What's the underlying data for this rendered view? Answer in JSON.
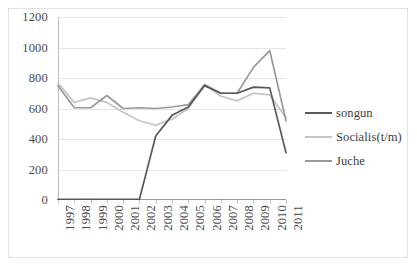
{
  "chart_data": {
    "type": "line",
    "title": "",
    "xlabel": "",
    "ylabel": "",
    "ylim": [
      0,
      1200
    ],
    "ytick_step": 200,
    "yticks": [
      "0",
      "200",
      "400",
      "600",
      "800",
      "1000",
      "1200"
    ],
    "grid": true,
    "legend_position": "right",
    "categories": [
      "1997",
      "1998",
      "1999",
      "2000",
      "2001",
      "2002",
      "2003",
      "2004",
      "2005",
      "2006",
      "2007",
      "2008",
      "2009",
      "2010",
      "2011"
    ],
    "series": [
      {
        "name": "songun",
        "color": "#595959",
        "values": [
          5,
          5,
          5,
          5,
          5,
          5,
          420,
          555,
          610,
          750,
          700,
          700,
          740,
          735,
          310
        ]
      },
      {
        "name": "Socialis(t/m)",
        "color": "#c4c4c4",
        "values": [
          765,
          640,
          670,
          640,
          575,
          520,
          490,
          530,
          600,
          760,
          680,
          650,
          700,
          690,
          540
        ]
      },
      {
        "name": "Juche",
        "color": "#9a9a9a",
        "values": [
          750,
          605,
          605,
          685,
          600,
          605,
          600,
          610,
          625,
          755,
          700,
          700,
          870,
          980,
          520
        ]
      }
    ]
  },
  "legend": {
    "items": [
      {
        "label": "songun",
        "color": "#595959"
      },
      {
        "label": "Socialis(t/m)",
        "color": "#c4c4c4"
      },
      {
        "label": "Juche",
        "color": "#9a9a9a"
      }
    ]
  },
  "colors": {
    "background": "#ffffff",
    "grid": "#e4e4e4",
    "axis": "#9a9a9a",
    "frame": "#e2e2e2",
    "tick_text": "#4a4a4a"
  }
}
